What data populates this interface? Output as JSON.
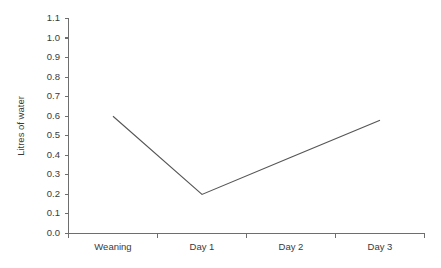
{
  "chart_data": {
    "type": "line",
    "title": "",
    "subtitle": "",
    "xlabel": "",
    "ylabel": "Litres of water",
    "categories": [
      "Weaning",
      "Day 1",
      "Day 2",
      "Day 3"
    ],
    "series": [
      {
        "name": "Litres of water",
        "values": [
          0.6,
          0.2,
          0.39,
          0.58
        ]
      }
    ],
    "x": [
      "Weaning",
      "Day 1",
      "Day 2",
      "Day 3"
    ],
    "ylim": [
      0.0,
      1.1
    ],
    "yticks": [
      "0.0",
      "0.1",
      "0.2",
      "0.3",
      "0.4",
      "0.5",
      "0.6",
      "0.7",
      "0.8",
      "0.9",
      "1.0",
      "1.1"
    ],
    "ytick_values": [
      0.0,
      0.1,
      0.2,
      0.3,
      0.4,
      0.5,
      0.6,
      0.7,
      0.8,
      0.9,
      1.0,
      1.1
    ],
    "grid": false,
    "legend": false,
    "legend_position": "none",
    "annotations": [],
    "line_color": "#555555",
    "axis_color": "#6e6e6e",
    "background_color": "#ffffff"
  },
  "axes": {
    "y_title": "Litres of water",
    "y_labels": {
      "t0": "1.1",
      "t1": "1.0",
      "t2": "0.9",
      "t3": "0.8",
      "t4": "0.7",
      "t5": "0.6",
      "t6": "0.5",
      "t7": "0.4",
      "t8": "0.3",
      "t9": "0.2",
      "t10": "0.1",
      "t11": "0.0"
    },
    "x_labels": {
      "c0": "Weaning",
      "c1": "Day 1",
      "c2": "Day 2",
      "c3": "Day 3"
    }
  }
}
